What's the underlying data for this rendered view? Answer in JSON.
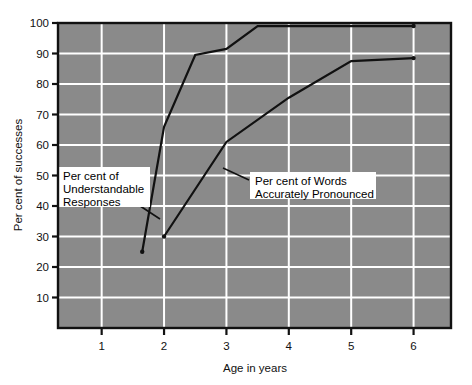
{
  "chart_data": {
    "type": "line",
    "title": "",
    "xlabel": "Age in years",
    "ylabel": "Per cent of successes",
    "xlim": [
      0.3,
      6.6
    ],
    "ylim": [
      0,
      100
    ],
    "xticks": [
      "1",
      "2",
      "3",
      "4",
      "5",
      "6"
    ],
    "xtick_values": [
      1,
      2,
      3,
      4,
      5,
      6
    ],
    "yticks": [
      "10",
      "20",
      "30",
      "40",
      "50",
      "60",
      "70",
      "80",
      "90",
      "100"
    ],
    "ytick_values": [
      10,
      20,
      30,
      40,
      50,
      60,
      70,
      80,
      90,
      100
    ],
    "grid": true,
    "grid_color": "#ffffff",
    "plot_background": "#8a8a8a",
    "legend": "annotations",
    "line_color": "#111111",
    "series": [
      {
        "name": "Per cent of Understandable Responses",
        "x": [
          1.65,
          2.0,
          2.5,
          3.0,
          3.5,
          6.0
        ],
        "values": [
          25,
          66,
          89.5,
          91.5,
          99,
          99
        ]
      },
      {
        "name": "Per cent of Words Accurately Pronounced",
        "x": [
          2.0,
          3.0,
          4.0,
          5.0,
          6.0
        ],
        "values": [
          30,
          61,
          75.5,
          87.5,
          88.5
        ]
      }
    ],
    "annotations": [
      {
        "id": "understandable-responses",
        "lines": [
          "Per cent of",
          "Understandable",
          "Responses"
        ],
        "box": {
          "x": 58,
          "y": 167,
          "w": 92,
          "h": 40
        },
        "leader_from": {
          "x": 131,
          "y": 200
        },
        "leader_to": {
          "x": 160,
          "y": 219
        }
      },
      {
        "id": "words-accurately-pronounced",
        "lines": [
          "Per cent of Words",
          "Accurately Pronounced"
        ],
        "box": {
          "x": 250,
          "y": 172,
          "w": 126,
          "h": 27
        },
        "leader_from": {
          "x": 249,
          "y": 180
        },
        "leader_to": {
          "x": 223,
          "y": 168
        }
      }
    ]
  },
  "axes": {
    "ylabel": "Per cent of successes",
    "xlabel": "Age in years"
  }
}
